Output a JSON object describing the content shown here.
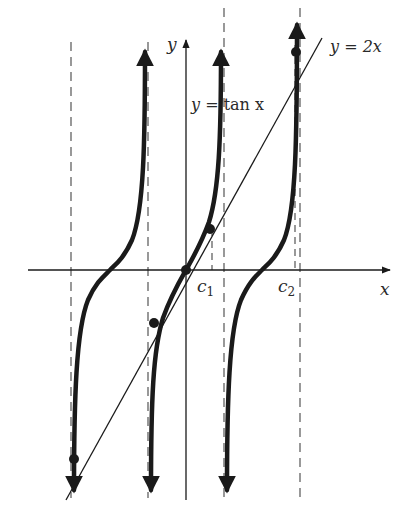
{
  "labels": {
    "y_axis": "y",
    "x_axis": "x",
    "line_eq_y": "y",
    "line_eq_rest": " = 2x",
    "tan_eq_y": "y",
    "tan_eq_rest": " = tan x",
    "c1_main": "c",
    "c1_sub": "1",
    "c2_main": "c",
    "c2_sub": "2"
  },
  "colors": {
    "ink": "#1a1a1a",
    "dashed": "#555555",
    "background": "#ffffff"
  },
  "diagram": {
    "curves": [
      {
        "name": "y = tan x",
        "type": "tangent branches",
        "branches": 3,
        "asymptotes": [
          "-3π/2",
          "-π/2",
          "π/2",
          "3π/2"
        ]
      },
      {
        "name": "y = 2x",
        "type": "line through origin"
      }
    ],
    "marked_points": [
      "origin",
      "c1 intersection",
      "-c1 intersection",
      "c2 intersection",
      "-c2 intersection"
    ],
    "marked_x_values": [
      "c1",
      "c2"
    ]
  }
}
